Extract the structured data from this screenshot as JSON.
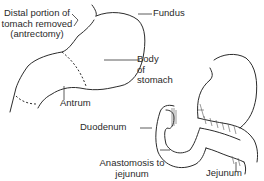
{
  "diagram": {
    "labels": {
      "distal_portion": [
        "Distal portion of",
        "tomach removed",
        "(antrectomy)"
      ],
      "fundus": "Fundus",
      "body": [
        "Body",
        "of",
        "stomach"
      ],
      "antrum": "Antrum",
      "duodenum": "Duodenum",
      "anastomosis": [
        "Anastomosis to",
        "jejunum"
      ],
      "jejunum": "Jejunum"
    },
    "colors": {
      "line": "#2b2b2b",
      "text": "#2a2a2a",
      "background": "#ffffff"
    }
  }
}
